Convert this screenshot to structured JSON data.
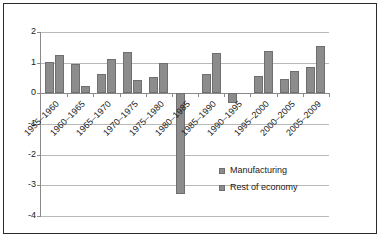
{
  "chart_data": {
    "type": "bar",
    "title": "",
    "subtitle": "",
    "xlabel": "",
    "ylabel": "",
    "ylim": [
      -4,
      2
    ],
    "yticks": [
      2,
      1,
      0,
      -1,
      -2,
      -3,
      -4
    ],
    "ytick_labels": [
      "2",
      "1",
      "0",
      "-1",
      "-2",
      "-3",
      "-4"
    ],
    "grid": true,
    "legend_position": "inside-bottom-right",
    "categories": [
      "1955–1960",
      "1960–1965",
      "1965–1970",
      "1970–1975",
      "1975–1980",
      "1980–1985",
      "1985–1990",
      "1990–1995",
      "1995–2000",
      "2000–2005",
      "2005–2009"
    ],
    "series": [
      {
        "name": "Manufacturing",
        "color": "#8c8c8c",
        "values": [
          1.02,
          0.95,
          0.62,
          1.35,
          0.53,
          -3.27,
          0.63,
          -0.33,
          0.58,
          0.48,
          0.85
        ]
      },
      {
        "name": "Rest of economy",
        "color": "#8c8c8c",
        "values": [
          1.24,
          0.25,
          1.11,
          0.42,
          1.0,
          0.0,
          1.32,
          0.0,
          1.38,
          0.72,
          1.55
        ]
      }
    ]
  },
  "legend": {
    "items": [
      {
        "label": "Manufacturing",
        "color": "#8c8c8c"
      },
      {
        "label": "Rest of economy",
        "color": "#8c8c8c"
      }
    ]
  },
  "colors": {
    "bar_fill": "#8c8c8c",
    "bar_stroke": "#6f6f6f",
    "gridline": "#b9b9b9",
    "axis": "#8a8a8a",
    "frame": "#2b2b2b",
    "text": "#1a1a1a",
    "background": "#ffffff"
  }
}
